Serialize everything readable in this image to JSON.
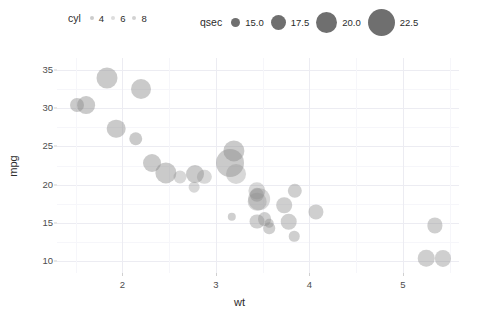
{
  "legends": {
    "cyl": {
      "title": "cyl",
      "keys": [
        {
          "label": "4",
          "size": 3.0
        },
        {
          "label": "6",
          "size": 3.0
        },
        {
          "label": "8",
          "size": 3.0
        }
      ]
    },
    "qsec": {
      "title": "qsec",
      "keys": [
        {
          "label": "15.0",
          "size": 9
        },
        {
          "label": "17.5",
          "size": 15
        },
        {
          "label": "20.0",
          "size": 21
        },
        {
          "label": "22.5",
          "size": 27
        }
      ]
    }
  },
  "axes": {
    "x": {
      "label": "wt",
      "ticks": [
        "2",
        "3",
        "4",
        "5"
      ],
      "tick_values": [
        2,
        3,
        4,
        5
      ],
      "range": [
        1.3,
        5.6
      ]
    },
    "y": {
      "label": "mpg",
      "ticks": [
        "35",
        "30",
        "25",
        "20",
        "15",
        "10"
      ],
      "tick_values": [
        35,
        30,
        25,
        20,
        15,
        10
      ],
      "range": [
        8.5,
        36.5
      ]
    }
  },
  "colors": {
    "point_fill": "#8c8c8c",
    "grid_major": "#ececf2",
    "grid_minor": "#f6f6fa",
    "panel_bg": "#ffffff",
    "text": "#2b2b2b",
    "tick_text": "#4d4d4d"
  },
  "chart_data": {
    "type": "scatter",
    "title": "",
    "xlabel": "wt",
    "ylabel": "mpg",
    "xlim": [
      1.3,
      5.6
    ],
    "ylim": [
      8.5,
      36.5
    ],
    "grid": true,
    "legend_position": "top",
    "size_legend": {
      "name": "qsec",
      "values": [
        15.0,
        17.5,
        20.0,
        22.5
      ]
    },
    "alpha_legend": {
      "name": "cyl",
      "values": [
        4,
        6,
        8
      ]
    },
    "points": [
      {
        "wt": 2.62,
        "mpg": 21.0,
        "qsec": 16.46,
        "cyl": 6
      },
      {
        "wt": 2.875,
        "mpg": 21.0,
        "qsec": 17.02,
        "cyl": 6
      },
      {
        "wt": 2.32,
        "mpg": 22.8,
        "qsec": 18.61,
        "cyl": 4
      },
      {
        "wt": 3.215,
        "mpg": 21.4,
        "qsec": 19.44,
        "cyl": 6
      },
      {
        "wt": 3.44,
        "mpg": 18.7,
        "qsec": 17.02,
        "cyl": 8
      },
      {
        "wt": 3.46,
        "mpg": 18.1,
        "qsec": 20.22,
        "cyl": 6
      },
      {
        "wt": 3.57,
        "mpg": 14.3,
        "qsec": 15.84,
        "cyl": 8
      },
      {
        "wt": 3.19,
        "mpg": 24.4,
        "qsec": 20.0,
        "cyl": 4
      },
      {
        "wt": 3.15,
        "mpg": 22.8,
        "qsec": 22.9,
        "cyl": 4
      },
      {
        "wt": 3.44,
        "mpg": 19.2,
        "qsec": 18.3,
        "cyl": 6
      },
      {
        "wt": 3.44,
        "mpg": 17.8,
        "qsec": 18.9,
        "cyl": 6
      },
      {
        "wt": 4.07,
        "mpg": 16.4,
        "qsec": 17.4,
        "cyl": 8
      },
      {
        "wt": 3.73,
        "mpg": 17.3,
        "qsec": 17.6,
        "cyl": 8
      },
      {
        "wt": 3.78,
        "mpg": 15.2,
        "qsec": 18.0,
        "cyl": 8
      },
      {
        "wt": 5.25,
        "mpg": 10.4,
        "qsec": 17.98,
        "cyl": 8
      },
      {
        "wt": 5.424,
        "mpg": 10.4,
        "qsec": 17.82,
        "cyl": 8
      },
      {
        "wt": 5.345,
        "mpg": 14.7,
        "qsec": 17.42,
        "cyl": 8
      },
      {
        "wt": 2.2,
        "mpg": 32.4,
        "qsec": 19.47,
        "cyl": 4
      },
      {
        "wt": 1.615,
        "mpg": 30.4,
        "qsec": 18.52,
        "cyl": 4
      },
      {
        "wt": 1.835,
        "mpg": 33.9,
        "qsec": 19.9,
        "cyl": 4
      },
      {
        "wt": 2.465,
        "mpg": 21.5,
        "qsec": 20.01,
        "cyl": 4
      },
      {
        "wt": 3.52,
        "mpg": 15.5,
        "qsec": 16.87,
        "cyl": 8
      },
      {
        "wt": 3.435,
        "mpg": 15.2,
        "qsec": 17.3,
        "cyl": 8
      },
      {
        "wt": 3.84,
        "mpg": 13.3,
        "qsec": 15.41,
        "cyl": 8
      },
      {
        "wt": 3.845,
        "mpg": 19.2,
        "qsec": 17.05,
        "cyl": 8
      },
      {
        "wt": 1.935,
        "mpg": 27.3,
        "qsec": 18.9,
        "cyl": 4
      },
      {
        "wt": 2.14,
        "mpg": 26.0,
        "qsec": 16.7,
        "cyl": 4
      },
      {
        "wt": 1.513,
        "mpg": 30.4,
        "qsec": 16.9,
        "cyl": 4
      },
      {
        "wt": 3.17,
        "mpg": 15.8,
        "qsec": 14.5,
        "cyl": 8
      },
      {
        "wt": 2.77,
        "mpg": 19.7,
        "qsec": 15.5,
        "cyl": 6
      },
      {
        "wt": 3.57,
        "mpg": 15.0,
        "qsec": 14.6,
        "cyl": 8
      },
      {
        "wt": 2.78,
        "mpg": 21.4,
        "qsec": 18.6,
        "cyl": 4
      }
    ]
  }
}
